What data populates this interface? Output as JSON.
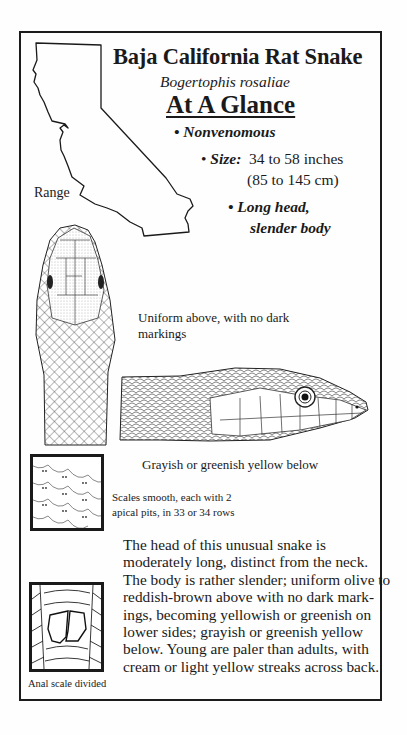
{
  "header": {
    "title": "Baja California Rat Snake",
    "scientific_name": "Bogertophis rosaliae",
    "section_heading": "At A Glance"
  },
  "facts": {
    "venom": {
      "bullet": "•",
      "text": "Nonvenomous"
    },
    "size": {
      "bullet": "•",
      "label": "Size:",
      "value": "34 to 58 inches",
      "value_metric": "(85 to 145 cm)"
    },
    "shape": {
      "bullet": "•",
      "line1": "Long head,",
      "line2": "slender body"
    }
  },
  "map": {
    "label": "Range",
    "region": "California"
  },
  "captions": {
    "dorsal": "Uniform above, with no dark markings",
    "ventral": "Grayish or greenish yellow below",
    "scales": "Scales smooth, each with 2 apical pits, in 33 or 34 rows",
    "anal": "Anal scale divided"
  },
  "description": {
    "lines": [
      "The head of this unusual snake is",
      "moderately long, distinct from the neck.",
      "The body is rather slender; uniform olive to",
      "reddish-brown above with no dark mark-",
      "ings, becoming yellowish or greenish on",
      "lower sides; grayish or greenish yellow",
      "below. Young are paler than adults, with",
      "cream or light yellow streaks across back."
    ]
  },
  "colors": {
    "ink": "#1a1a1a",
    "paper": "#fefefe"
  }
}
